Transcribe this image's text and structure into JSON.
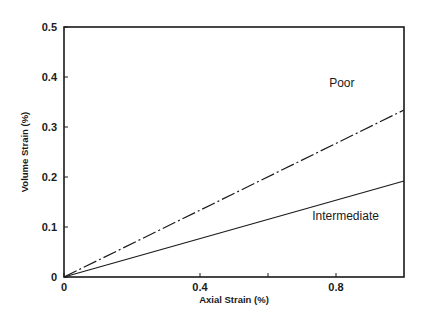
{
  "chart_data": {
    "type": "line",
    "title": "",
    "xlabel": "Axial Strain (%)",
    "ylabel": "Volume Strain (%)",
    "xlim": [
      0,
      1.0
    ],
    "ylim": [
      0,
      0.5
    ],
    "xticks": [
      0,
      0.4,
      0.8
    ],
    "xtick_labels": [
      "0",
      "0.4",
      "0.8"
    ],
    "yticks": [
      0,
      0.1,
      0.2,
      0.3,
      0.4,
      0.5
    ],
    "ytick_labels": [
      "0",
      "0.1",
      "0.2",
      "0.3",
      "0.4",
      "0.5"
    ],
    "grid": false,
    "legend": "none (inline annotations)",
    "series": [
      {
        "name": "Poor",
        "style": "dash-dot",
        "x": [
          0,
          1.0
        ],
        "y": [
          0,
          0.334
        ]
      },
      {
        "name": "Intermediate",
        "style": "solid",
        "x": [
          0,
          1.0
        ],
        "y": [
          0,
          0.192
        ]
      }
    ],
    "annotations": [
      {
        "text": "Poor",
        "x": 0.78,
        "y": 0.38
      },
      {
        "text": "Intermediate",
        "x": 0.73,
        "y": 0.115
      }
    ]
  },
  "colors": {
    "ink": "#1a1a1a",
    "background": "#ffffff"
  }
}
